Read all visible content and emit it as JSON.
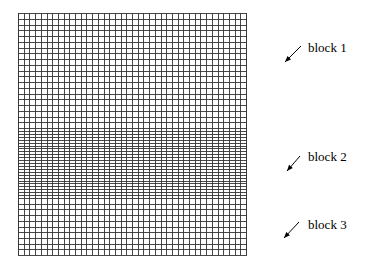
{
  "diagram": {
    "type": "structured-mesh",
    "grid": {
      "x_left": 18,
      "x_right": 246,
      "columns": 40,
      "line_color": "#333333",
      "border_color": "#222222"
    },
    "blocks": [
      {
        "id": "block1",
        "label": "block 1",
        "y_top": 13,
        "y_bottom": 128,
        "rows": 20,
        "label_x": 308,
        "label_y": 52,
        "arrow": {
          "x1": 301,
          "y1": 46,
          "x2": 285,
          "y2": 62
        }
      },
      {
        "id": "block2",
        "label": "block 2",
        "y_top": 128,
        "y_bottom": 198,
        "rows": 24,
        "label_x": 308,
        "label_y": 161,
        "arrow": {
          "x1": 300,
          "y1": 156,
          "x2": 287,
          "y2": 171
        }
      },
      {
        "id": "block3",
        "label": "block 3",
        "y_top": 198,
        "y_bottom": 255,
        "rows": 10,
        "label_x": 308,
        "label_y": 229,
        "arrow": {
          "x1": 299,
          "y1": 222,
          "x2": 284,
          "y2": 238
        }
      }
    ]
  }
}
